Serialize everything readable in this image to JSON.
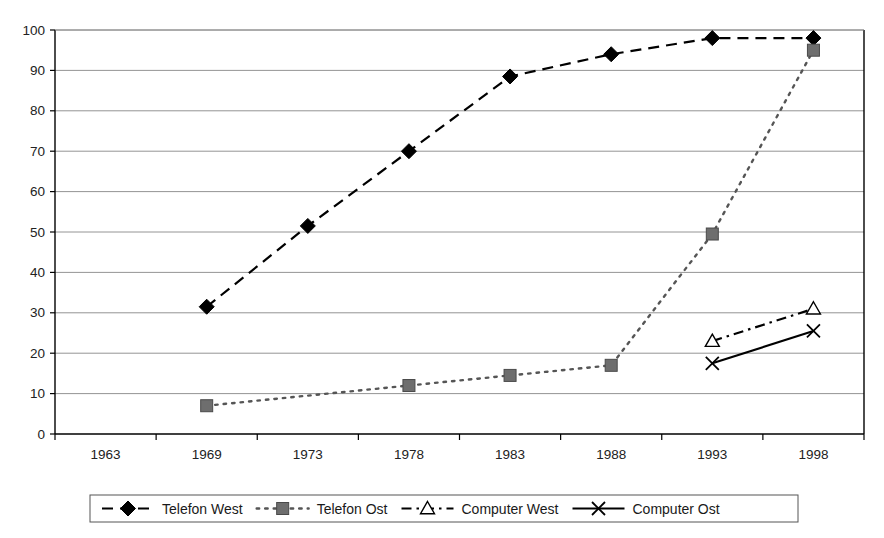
{
  "chart_data": {
    "type": "line",
    "title": "",
    "subtitle": "",
    "xlabel": "",
    "ylabel": "",
    "categories": [
      "1963",
      "1969",
      "1973",
      "1978",
      "1983",
      "1988",
      "1993",
      "1998"
    ],
    "ylim": [
      0,
      100
    ],
    "y_ticks": [
      "0",
      "10",
      "20",
      "30",
      "40",
      "50",
      "60",
      "70",
      "80",
      "90",
      "100"
    ],
    "grid": "horizontal",
    "legend_position": "bottom",
    "series": [
      {
        "name": "Telefon West",
        "marker": "filled-diamond",
        "line_style": "dashed",
        "color": "#000000",
        "values": [
          null,
          31.5,
          51.5,
          70,
          88.5,
          94,
          98,
          98
        ]
      },
      {
        "name": "Telefon Ost",
        "marker": "filled-square",
        "line_style": "dotted",
        "color": "#555555",
        "values": [
          null,
          7,
          null,
          12,
          14.5,
          17,
          49.5,
          95
        ]
      },
      {
        "name": "Computer West",
        "marker": "open-triangle",
        "line_style": "dash-dot",
        "color": "#000000",
        "values": [
          null,
          null,
          null,
          null,
          null,
          null,
          23,
          31
        ]
      },
      {
        "name": "Computer Ost",
        "marker": "cross-x",
        "line_style": "solid",
        "color": "#000000",
        "values": [
          null,
          null,
          null,
          null,
          null,
          null,
          17.5,
          25.5
        ]
      }
    ]
  },
  "legend": {
    "items": [
      {
        "label": "Telefon West"
      },
      {
        "label": "Telefon Ost"
      },
      {
        "label": "Computer West"
      },
      {
        "label": "Computer Ost"
      }
    ]
  },
  "colors": {
    "axis": "#000000",
    "grid": "#888888",
    "series_dark": "#000000",
    "series_gray": "#666666",
    "background": "#ffffff"
  }
}
